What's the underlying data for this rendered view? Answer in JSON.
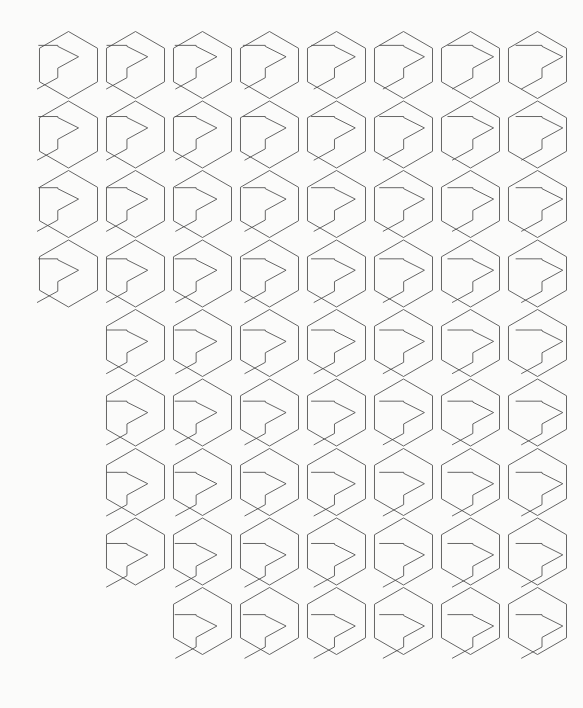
{
  "figure": {
    "background_color": "#fbfbfa",
    "stroke_color": "#4a4a4a",
    "stroke_width": 0.85,
    "canvas_width": 583,
    "canvas_height": 708
  },
  "grid": {
    "columns": 8,
    "rows": 9,
    "col_spacing": 67.0,
    "row_spacing": 69.5,
    "origin_x": 68.5,
    "origin_y": 65.0,
    "hex_radius": 33.5,
    "hex_orientation": "pointy-top-flat-side",
    "row_layout": [
      {
        "row": 1,
        "start_col": 1,
        "count": 8
      },
      {
        "row": 2,
        "start_col": 1,
        "count": 8
      },
      {
        "row": 3,
        "start_col": 1,
        "count": 8
      },
      {
        "row": 4,
        "start_col": 1,
        "count": 8
      },
      {
        "row": 5,
        "start_col": 2,
        "count": 7
      },
      {
        "row": 6,
        "start_col": 2,
        "count": 7
      },
      {
        "row": 7,
        "start_col": 2,
        "count": 7
      },
      {
        "row": 8,
        "start_col": 2,
        "count": 7
      },
      {
        "row": 9,
        "start_col": 3,
        "count": 6
      }
    ],
    "total_cells": 67
  },
  "glyph_params": {
    "comment": "Each cell glyph is a polyline built from normalized control points scaled by hex_radius. row index drives vertical stem/foot extension; col index drives horizontal shear and arrow aperture.",
    "row_shift_start": -0.62,
    "row_shift_step": 0.165,
    "col_shear_start": -0.4,
    "col_shear_step": 0.118,
    "arrow_depth": 0.52,
    "arrow_half_height": 0.3,
    "stem_length": 0.46,
    "foot_length": 0.4
  },
  "chart_data": {
    "type": "scatter",
    "xlabel": "",
    "ylabel": "",
    "x": [
      1,
      2,
      3,
      4,
      5,
      6,
      7,
      8,
      1,
      2,
      3,
      4,
      5,
      6,
      7,
      8,
      1,
      2,
      3,
      4,
      5,
      6,
      7,
      8,
      1,
      2,
      3,
      4,
      5,
      6,
      7,
      8,
      2,
      3,
      4,
      5,
      6,
      7,
      8,
      2,
      3,
      4,
      5,
      6,
      7,
      8,
      2,
      3,
      4,
      5,
      6,
      7,
      8,
      2,
      3,
      4,
      5,
      6,
      7,
      8,
      3,
      4,
      5,
      6,
      7,
      8
    ],
    "y": [
      1,
      1,
      1,
      1,
      1,
      1,
      1,
      1,
      2,
      2,
      2,
      2,
      2,
      2,
      2,
      2,
      3,
      3,
      3,
      3,
      3,
      3,
      3,
      3,
      4,
      4,
      4,
      4,
      4,
      4,
      4,
      4,
      5,
      5,
      5,
      5,
      5,
      5,
      5,
      6,
      6,
      6,
      6,
      6,
      6,
      6,
      7,
      7,
      7,
      7,
      7,
      7,
      7,
      8,
      8,
      8,
      8,
      8,
      8,
      8,
      9,
      9,
      9,
      9,
      9,
      9
    ],
    "series": [
      {
        "name": "hexagon-glyph",
        "values": [
          1,
          1,
          1,
          1,
          1,
          1,
          1,
          1,
          1,
          1,
          1,
          1,
          1,
          1,
          1,
          1,
          1,
          1,
          1,
          1,
          1,
          1,
          1,
          1,
          1,
          1,
          1,
          1,
          1,
          1,
          1,
          1,
          1,
          1,
          1,
          1,
          1,
          1,
          1,
          1,
          1,
          1,
          1,
          1,
          1,
          1,
          1,
          1,
          1,
          1,
          1,
          1,
          1,
          1,
          1,
          1,
          1,
          1,
          1,
          1,
          1,
          1,
          1,
          1,
          1,
          1
        ]
      }
    ],
    "legend": [],
    "grid": false,
    "xlim": [
      0,
      9
    ],
    "ylim": [
      0,
      10
    ]
  }
}
